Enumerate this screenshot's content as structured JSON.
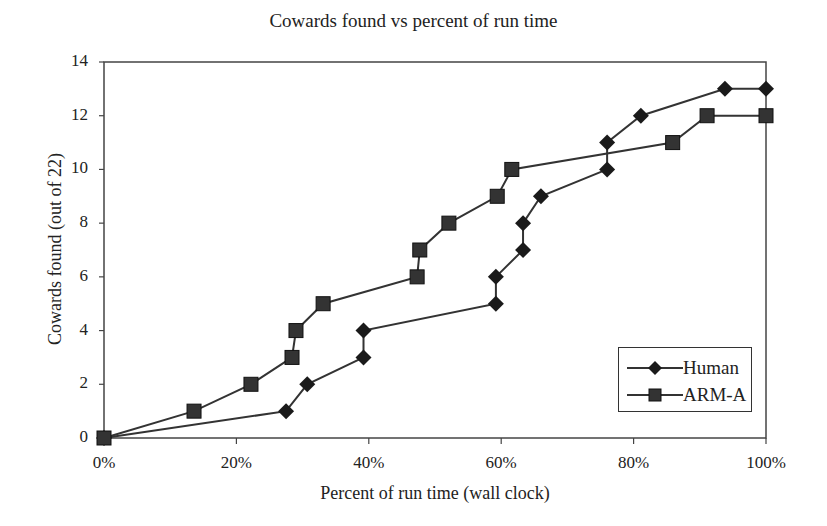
{
  "chart_data": {
    "type": "line",
    "title": "Cowards found vs percent of run time",
    "xlabel": "Percent of run time (wall clock)",
    "ylabel": "Cowards found (out of 22)",
    "xlim": [
      0,
      100
    ],
    "ylim": [
      0,
      14
    ],
    "x_ticks": [
      "0%",
      "20%",
      "40%",
      "60%",
      "80%",
      "100%"
    ],
    "y_ticks": [
      "0",
      "2",
      "4",
      "6",
      "8",
      "10",
      "12",
      "14"
    ],
    "grid": false,
    "legend_position": "lower right",
    "series": [
      {
        "name": "Human",
        "marker": "diamond",
        "x": [
          0,
          27.5,
          30.7,
          39.2,
          39.2,
          59.2,
          59.2,
          63.3,
          63.3,
          66.0,
          76.0,
          76.0,
          81.1,
          93.8,
          100
        ],
        "y": [
          0,
          1,
          2,
          3,
          4,
          5,
          6,
          7,
          8,
          9,
          10,
          11,
          12,
          13,
          13
        ]
      },
      {
        "name": "ARM-A",
        "marker": "square",
        "x": [
          0,
          13.6,
          22.2,
          28.4,
          29.0,
          33.1,
          47.3,
          47.7,
          52.1,
          59.4,
          61.6,
          85.9,
          91.1,
          100
        ],
        "y": [
          0,
          1,
          2,
          3,
          4,
          5,
          6,
          7,
          8,
          9,
          10,
          11,
          12,
          12
        ]
      }
    ]
  },
  "colors": {
    "line": "#333333",
    "marker": "#1a1a1a",
    "axis": "#444444"
  }
}
